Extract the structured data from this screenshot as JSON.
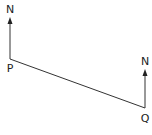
{
  "diagram": {
    "type": "bearing-diagram",
    "points": {
      "P": {
        "label": "P",
        "north_label": "N"
      },
      "Q": {
        "label": "Q",
        "north_label": "N"
      }
    },
    "colors": {
      "line": "#333333",
      "text": "#222222",
      "background": "#ffffff"
    }
  }
}
